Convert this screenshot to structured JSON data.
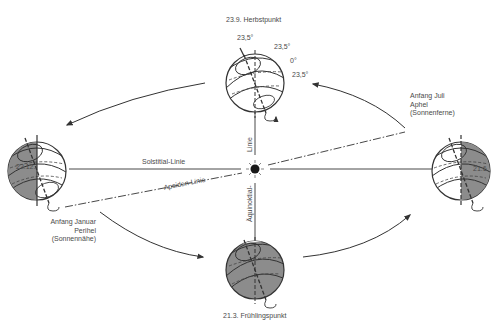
{
  "diagram": {
    "title_top": "23.9. Herbstpunkt",
    "title_bottom": "21.3. Frühlingspunkt",
    "label_left_date": "22.12.",
    "label_right_date": "21.6.",
    "perihel": {
      "line1": "Anfang Januar",
      "line2": "Perihel",
      "line3": "(Sonnennähe)"
    },
    "aphel": {
      "line1": "Anfang Juli",
      "line2": "Aphel",
      "line3": "(Sonnenferne)"
    },
    "angles": {
      "a1": "23,5°",
      "a2": "23,5°",
      "a3": "0°",
      "a4": "23,5°"
    },
    "lines": {
      "solstitial": "Solstitial-Linie",
      "apsiden": "Apsiden-Linie",
      "aequinoktial_lower": "Äquinoktial-",
      "aequinoktial_upper": "Linie"
    },
    "colors": {
      "stroke": "#333333",
      "shade": "#8c8c8c",
      "text": "#4a4a4a",
      "sun": "#1a1a1a"
    }
  }
}
